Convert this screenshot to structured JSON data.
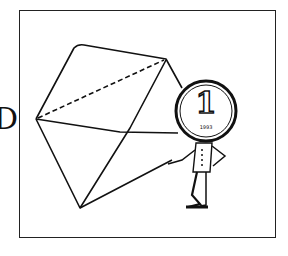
{
  "side_label": "D",
  "illustration": {
    "subject": "open envelope with coin-headed character",
    "coin": {
      "value": "1",
      "caption": "1993"
    },
    "colors": {
      "line": "#111111",
      "background": "#ffffff",
      "frame": "#222222"
    }
  }
}
